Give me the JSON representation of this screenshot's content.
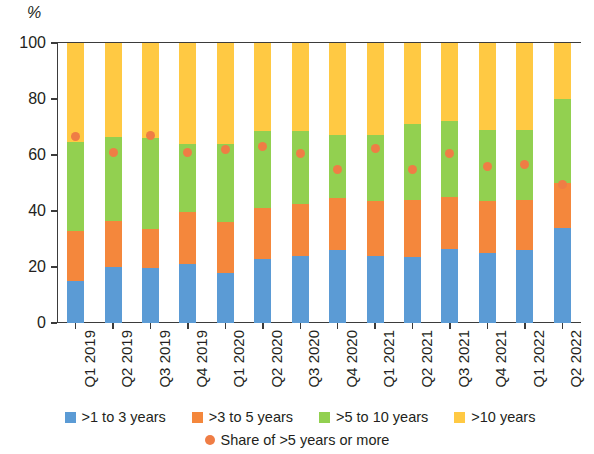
{
  "axis": {
    "unit_label": "%",
    "y_ticks": [
      "0",
      "20",
      "40",
      "60",
      "80",
      "100"
    ],
    "y_min": 0,
    "y_max": 100
  },
  "legend": {
    "row1": [
      {
        "label": ">1 to 3 years",
        "color": "#5B9BD5",
        "shape": "square"
      },
      {
        "label": ">3 to 5 years",
        "color": "#F4873C",
        "shape": "square"
      },
      {
        "label": ">5 to 10 years",
        "color": "#92D050",
        "shape": "square"
      },
      {
        "label": ">10 years",
        "color": "#FFC943",
        "shape": "square"
      }
    ],
    "row2": [
      {
        "label": "Share of >5 years or more",
        "color": "#EF7D45",
        "shape": "circle"
      }
    ]
  },
  "chart_data": {
    "type": "bar",
    "title": "",
    "subtitle": "",
    "xlabel": "",
    "ylabel": "%",
    "ylim": [
      0,
      100
    ],
    "yticks": [
      0,
      20,
      40,
      60,
      80,
      100
    ],
    "grid": false,
    "stacked": true,
    "stack_total": 100,
    "legend_position": "bottom",
    "categories": [
      "Q1 2019",
      "Q2 2019",
      "Q3 2019",
      "Q4 2019",
      "Q1 2020",
      "Q2 2020",
      "Q3 2020",
      "Q4 2020",
      "Q1 2021",
      "Q2 2021",
      "Q3 2021",
      "Q4 2021",
      "Q1 2022",
      "Q2 2022"
    ],
    "series": [
      {
        "name": ">1 to 3 years",
        "color": "#5B9BD5",
        "values": [
          15,
          20,
          19.5,
          21,
          18,
          23,
          24,
          26,
          24,
          23.5,
          26.5,
          25,
          26,
          34
        ]
      },
      {
        "name": ">3 to 5 years",
        "color": "#F4873C",
        "values": [
          18,
          16.5,
          14,
          18.5,
          18,
          18,
          18.5,
          18.5,
          19.5,
          20.5,
          18.5,
          18.5,
          18,
          16
        ]
      },
      {
        "name": ">5 to 10 years",
        "color": "#92D050",
        "values": [
          31.5,
          30,
          32.5,
          24.5,
          28,
          27.5,
          26,
          22.5,
          23.5,
          27,
          27,
          25.5,
          25,
          30
        ]
      },
      {
        "name": ">10 years",
        "color": "#FFC943",
        "values": [
          35.5,
          33.5,
          34,
          36,
          36,
          31.5,
          31.5,
          33,
          33,
          29,
          28,
          31,
          31,
          20
        ]
      }
    ],
    "markers": {
      "name": "Share of >5 years or more",
      "color": "#EF7D45",
      "values": [
        66.5,
        61,
        67,
        61,
        62,
        63,
        60.5,
        55,
        62.5,
        55,
        60.5,
        56,
        56.5,
        49.5
      ]
    }
  }
}
